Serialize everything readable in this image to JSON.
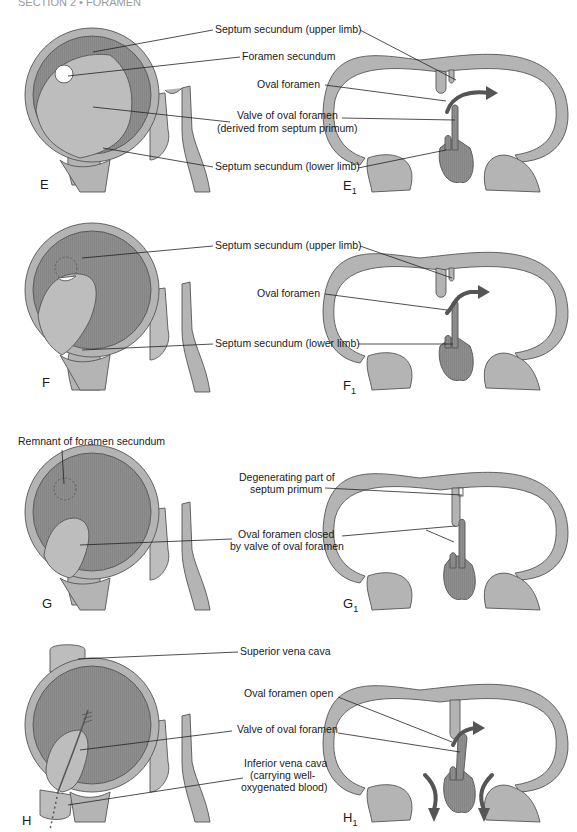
{
  "header": {
    "text": "SECTION 2 • FORAMEN"
  },
  "colors": {
    "wall": "#b4b4b4",
    "septum_dark": "#8c8c8c",
    "septum_light": "#bdbdbd",
    "outline": "#555555",
    "text": "#1a1a1a"
  },
  "panels": [
    {
      "id": "E",
      "left_label": "E",
      "right_label": "E",
      "right_sub": "1",
      "labels": [
        {
          "lines": [
            "Septum secundum (upper limb)"
          ]
        },
        {
          "lines": [
            "Foramen secundum"
          ]
        },
        {
          "lines": [
            "Oval foramen"
          ]
        },
        {
          "lines": [
            "Valve of oval foramen",
            "(derived from septum primum)"
          ]
        },
        {
          "lines": [
            "Septum secundum (lower limb)"
          ]
        }
      ]
    },
    {
      "id": "F",
      "left_label": "F",
      "right_label": "F",
      "right_sub": "1",
      "labels": [
        {
          "lines": [
            "Septum secundum (upper limb)"
          ]
        },
        {
          "lines": [
            "Oval foramen"
          ]
        },
        {
          "lines": [
            "Septum secundum (lower limb)"
          ]
        }
      ]
    },
    {
      "id": "G",
      "left_label": "G",
      "right_label": "G",
      "right_sub": "1",
      "labels": [
        {
          "lines": [
            "Remnant of foramen secundum"
          ]
        },
        {
          "lines": [
            "Degenerating part of",
            "septum primum"
          ]
        },
        {
          "lines": [
            "Oval foramen closed",
            "by valve of oval foramen"
          ]
        }
      ]
    },
    {
      "id": "H",
      "left_label": "H",
      "right_label": "H",
      "right_sub": "1",
      "labels": [
        {
          "lines": [
            "Superior vena cava"
          ]
        },
        {
          "lines": [
            "Oval foramen open"
          ]
        },
        {
          "lines": [
            "Valve of oval foramen"
          ]
        },
        {
          "lines": [
            "Inferior vena cava",
            "(carrying well-",
            "oxygenated blood)"
          ]
        }
      ]
    }
  ]
}
